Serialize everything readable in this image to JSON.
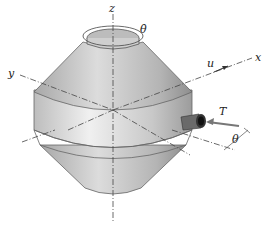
{
  "diagram": {
    "labels": {
      "z": "z",
      "theta_dot": "θ̇",
      "y": "y",
      "u": "u",
      "x": "x",
      "T": "T",
      "theta": "θ"
    },
    "colors": {
      "body_light": "#e8e8e8",
      "body_mid": "#c4c4c4",
      "body_dark": "#9a9a9a",
      "outline": "#555555",
      "axis": "#444444",
      "thruster": "#5a5a5a"
    }
  }
}
